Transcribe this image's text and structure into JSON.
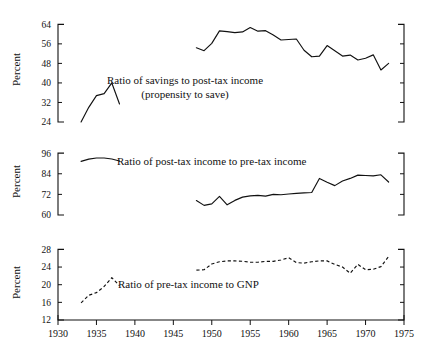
{
  "figure": {
    "axis_title": "Percent",
    "x_axis": {
      "label": "",
      "min": 1930,
      "max": 1975,
      "ticks": [
        1930,
        1935,
        1940,
        1945,
        1950,
        1955,
        1960,
        1965,
        1970,
        1975
      ],
      "tick_labels": [
        "1930",
        "1935",
        "1940",
        "1945",
        "1950",
        "1955",
        "1960",
        "1965",
        "1970",
        "1975"
      ]
    }
  },
  "chart_data": [
    {
      "type": "line",
      "panel": 1,
      "title": "",
      "annotation": "Ratio of savings to post-tax income",
      "annotation_line2": "(propensity to save)",
      "xlabel": "",
      "ylabel": "Percent",
      "xlim": [
        1930,
        1975
      ],
      "ylim": [
        24,
        67
      ],
      "yticks": [
        24,
        32,
        40,
        48,
        56,
        64
      ],
      "ytick_labels": [
        "24",
        "32",
        "40",
        "48",
        "56",
        "64"
      ],
      "grid": false,
      "legend": "none",
      "linestyle": "solid",
      "series": [
        {
          "name": "savings to post-tax income (prewar)",
          "x": [
            1933,
            1934,
            1935,
            1936,
            1937,
            1938
          ],
          "values": [
            24.0,
            30.0,
            34.8,
            35.6,
            40.0,
            31.4
          ]
        },
        {
          "name": "savings to post-tax income (postwar)",
          "x": [
            1948,
            1949,
            1950,
            1951,
            1952,
            1953,
            1954,
            1955,
            1956,
            1957,
            1958,
            1959,
            1960,
            1961,
            1962,
            1963,
            1964,
            1965,
            1966,
            1967,
            1968,
            1969,
            1970,
            1971,
            1972,
            1973
          ],
          "values": [
            54.4,
            53.2,
            56.2,
            61.3,
            61.0,
            60.6,
            60.9,
            62.7,
            61.2,
            61.4,
            59.6,
            57.6,
            57.8,
            58.0,
            53.4,
            50.7,
            51.0,
            55.3,
            53.2,
            51.0,
            51.4,
            49.4,
            50.1,
            51.5,
            45.3,
            48.0
          ]
        }
      ]
    },
    {
      "type": "line",
      "panel": 2,
      "title": "",
      "annotation": "Ratio of post-tax income to pre-tax income",
      "xlabel": "",
      "ylabel": "Percent",
      "xlim": [
        1930,
        1975
      ],
      "ylim": [
        60,
        99
      ],
      "yticks": [
        60,
        72,
        84,
        96
      ],
      "ytick_labels": [
        "60",
        "72",
        "84",
        "96"
      ],
      "grid": false,
      "legend": "none",
      "linestyle": "solid",
      "series": [
        {
          "name": "post-tax to pre-tax income (prewar)",
          "x": [
            1933,
            1934,
            1935,
            1936,
            1937,
            1938
          ],
          "values": [
            91.2,
            92.5,
            93.2,
            93.2,
            92.6,
            91.4
          ]
        },
        {
          "name": "post-tax to pre-tax income (postwar)",
          "x": [
            1948,
            1949,
            1950,
            1951,
            1952,
            1953,
            1954,
            1955,
            1956,
            1957,
            1958,
            1959,
            1960,
            1961,
            1962,
            1963,
            1964,
            1965,
            1966,
            1967,
            1968,
            1969,
            1970,
            1971,
            1972,
            1973
          ],
          "values": [
            68.4,
            65.6,
            66.5,
            70.8,
            65.9,
            68.5,
            70.4,
            71.1,
            71.4,
            71.0,
            72.0,
            71.8,
            72.2,
            72.6,
            72.9,
            73.1,
            81.3,
            79.1,
            77.1,
            79.8,
            81.3,
            83.2,
            83.0,
            82.8,
            83.4,
            79.2
          ]
        }
      ]
    },
    {
      "type": "line",
      "panel": 3,
      "title": "",
      "annotation": "Ratio of pre-tax income to GNP",
      "xlabel": "",
      "ylabel": "Percent",
      "xlim": [
        1930,
        1975
      ],
      "ylim": [
        12,
        29
      ],
      "yticks": [
        12,
        16,
        20,
        24,
        28
      ],
      "ytick_labels": [
        "12",
        "16",
        "20",
        "24",
        "28"
      ],
      "grid": false,
      "legend": "none",
      "linestyle": "dashed",
      "series": [
        {
          "name": "pre-tax income to GNP (prewar)",
          "x": [
            1933,
            1934,
            1935,
            1936,
            1937,
            1938
          ],
          "values": [
            15.9,
            17.6,
            18.2,
            19.6,
            21.6,
            19.8
          ]
        },
        {
          "name": "pre-tax income to GNP (postwar)",
          "x": [
            1948,
            1949,
            1950,
            1951,
            1952,
            1953,
            1954,
            1955,
            1956,
            1957,
            1958,
            1959,
            1960,
            1961,
            1962,
            1963,
            1964,
            1965,
            1966,
            1967,
            1968,
            1969,
            1970,
            1971,
            1972,
            1973
          ],
          "values": [
            23.3,
            23.4,
            24.7,
            25.2,
            25.4,
            25.4,
            25.3,
            25.1,
            25.1,
            25.3,
            25.3,
            25.6,
            26.1,
            25.0,
            24.9,
            25.2,
            25.4,
            25.4,
            24.6,
            24.0,
            22.6,
            24.6,
            23.4,
            23.5,
            24.1,
            26.4
          ]
        }
      ]
    }
  ]
}
